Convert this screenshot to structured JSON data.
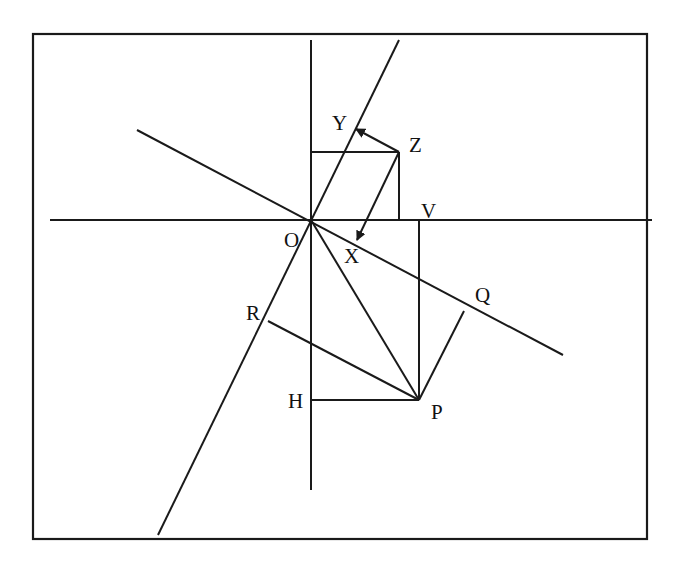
{
  "diagram": {
    "type": "geometric-construction",
    "frame": {
      "x": 33,
      "y": 34,
      "width": 614,
      "height": 505
    },
    "colors": {
      "stroke": "#1a1a1a",
      "background": "#ffffff",
      "text": "#111111"
    },
    "points": {
      "O": {
        "x": 311,
        "y": 220
      },
      "Z": {
        "x": 399,
        "y": 152
      },
      "V": {
        "x": 419,
        "y": 220
      },
      "P": {
        "x": 419,
        "y": 400
      },
      "H": {
        "x": 311,
        "y": 400
      }
    },
    "labels": {
      "O": "O",
      "X": "X",
      "Y": "Y",
      "Z": "Z",
      "V": "V",
      "Q": "Q",
      "R": "R",
      "H": "H",
      "P": "P"
    },
    "lines": [
      {
        "name": "horizontal-axis",
        "from": [
          50,
          220
        ],
        "to": [
          652,
          220
        ]
      },
      {
        "name": "vertical-axis",
        "from": [
          311,
          40
        ],
        "to": [
          311,
          490
        ]
      },
      {
        "name": "oblique-axis-OR",
        "from": [
          399,
          40
        ],
        "to": [
          158,
          535
        ]
      },
      {
        "name": "oblique-axis-OQ",
        "from": [
          137,
          130
        ],
        "to": [
          563,
          355
        ]
      },
      {
        "name": "segment-OP",
        "from": [
          311,
          220
        ],
        "to": [
          419,
          400
        ]
      },
      {
        "name": "segment-VP",
        "from": [
          419,
          220
        ],
        "to": [
          419,
          400
        ]
      },
      {
        "name": "segment-HP",
        "from": [
          311,
          400
        ],
        "to": [
          419,
          400
        ]
      },
      {
        "name": "perpendicular-P-to-OR",
        "from": [
          268,
          321
        ],
        "to": [
          419,
          400
        ]
      },
      {
        "name": "perpendicular-P-to-OQ",
        "from": [
          419,
          400
        ],
        "to": [
          464,
          311
        ]
      },
      {
        "name": "projection-Z-horizontal",
        "from": [
          311,
          152
        ],
        "to": [
          399,
          152
        ]
      },
      {
        "name": "projection-Z-vertical",
        "from": [
          399,
          152
        ],
        "to": [
          399,
          220
        ]
      }
    ],
    "arrows": [
      {
        "name": "arrow-Z-to-Y",
        "from": [
          399,
          152
        ],
        "to": [
          355,
          129
        ]
      },
      {
        "name": "arrow-Z-to-X",
        "from": [
          399,
          152
        ],
        "to": [
          356,
          241
        ]
      }
    ]
  }
}
